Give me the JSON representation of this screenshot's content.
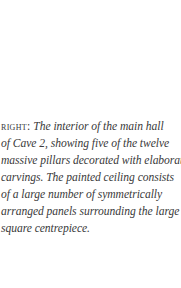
{
  "caption": {
    "label": "RIGHT:",
    "lines": [
      " The interior of the main hall",
      "of Cave 2, showing five of the twelve",
      "massive pillars decorated with elaborate",
      "carvings. The painted ceiling consists",
      "of a large number of symmetrically",
      "arranged panels surrounding the large",
      "square centrepiece."
    ]
  }
}
